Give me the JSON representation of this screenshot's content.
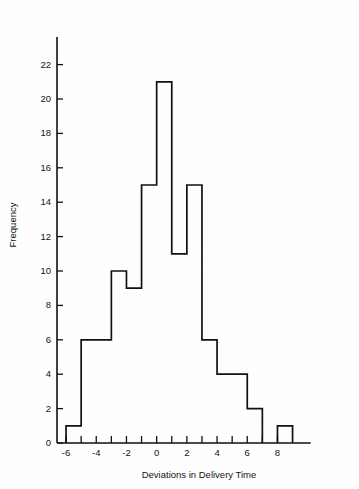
{
  "chart_data": {
    "type": "bar",
    "title": "",
    "subtitle": "",
    "xlabel": "Deviations in Delivery Time",
    "ylabel": "Frequency",
    "xlim": [
      -6.6,
      10.2
    ],
    "ylim": [
      0,
      23.6
    ],
    "grid": false,
    "legend": null,
    "bin_width": 1,
    "x_tick_labels": [
      "-6",
      "-4",
      "-2",
      "0",
      "2",
      "4",
      "6",
      "8"
    ],
    "x_tick_values": [
      -6,
      -4,
      -2,
      0,
      2,
      4,
      6,
      8
    ],
    "x_minor_tick_values": [
      -6,
      -5,
      -4,
      -3,
      -2,
      -1,
      0,
      1,
      2,
      3,
      4,
      5,
      6,
      7,
      8
    ],
    "y_tick_labels": [
      "0",
      "2",
      "4",
      "6",
      "8",
      "10",
      "12",
      "14",
      "16",
      "18",
      "20",
      "22"
    ],
    "y_tick_values": [
      0,
      2,
      4,
      6,
      8,
      10,
      12,
      14,
      16,
      18,
      20,
      22
    ],
    "bin_edges": [
      -6,
      -5,
      -4,
      -3,
      -2,
      -1,
      0,
      1,
      2,
      3,
      4,
      5,
      6,
      7,
      8,
      9
    ],
    "categories": [
      "-6 to -5",
      "-5 to -4",
      "-4 to -3",
      "-3 to -2",
      "-2 to -1",
      "-1 to 0",
      "0 to 1",
      "1 to 2",
      "2 to 3",
      "3 to 4",
      "4 to 5",
      "5 to 6",
      "6 to 7",
      "7 to 8",
      "8 to 9"
    ],
    "values": [
      1,
      6,
      6,
      10,
      9,
      15,
      21,
      11,
      15,
      6,
      4,
      4,
      2,
      0,
      1
    ],
    "total_count": 111,
    "series": [
      {
        "name": "Frequency",
        "values": [
          1,
          6,
          6,
          10,
          9,
          15,
          21,
          11,
          15,
          6,
          4,
          4,
          2,
          0,
          1
        ]
      }
    ],
    "style": {
      "bar_fill": "#ffffff",
      "bar_stroke": "#111111",
      "axis_color": "#111111",
      "background": "#fefefe"
    }
  },
  "figure": {
    "x_axis_title": "Deviations in Delivery Time",
    "y_axis_title": "Frequency"
  }
}
